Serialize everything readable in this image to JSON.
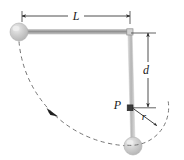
{
  "figure": {
    "background_color": "#ffffff",
    "width": 184,
    "height": 160
  },
  "labels": {
    "length_L": "L",
    "distance_d": "d",
    "point_P": "P",
    "radius_r": "r"
  },
  "colors": {
    "rod": "#a8a8a8",
    "sphere_fill": "#c9c9c9",
    "sphere_highlight": "#e8e8e8",
    "dimension_line": "#3a3a3a",
    "dashed_arc": "#6a6a6a",
    "point_marker": "#2b2b2b",
    "label_text": "#1a1a1a"
  },
  "geometry": {
    "pivot": {
      "x": 130,
      "y": 32
    },
    "sphere_left": {
      "x": 19,
      "y": 32,
      "radius": 9
    },
    "sphere_bottom": {
      "x": 133,
      "y": 146,
      "radius": 9
    },
    "point_P": {
      "x": 130,
      "y": 108
    },
    "rod_horizontal": {
      "x1": 19,
      "y1": 32,
      "x2": 130,
      "y2": 32
    },
    "rod_vertical": {
      "x1": 130,
      "y1": 32,
      "x2": 133,
      "y2": 146
    },
    "dimension_L": {
      "y": 16,
      "x1": 22,
      "x2": 130
    },
    "dimension_d": {
      "x": 148,
      "y1": 33,
      "y2": 107
    },
    "arc_large_radius": 114,
    "arc_small_radius": 38
  },
  "annotations": {
    "L_description": "horizontal dimension from left sphere to pivot",
    "d_description": "vertical dimension from pivot down to point P",
    "r_description": "radius from point P to the small dashed arc",
    "P_description": "marked point on the rod"
  }
}
